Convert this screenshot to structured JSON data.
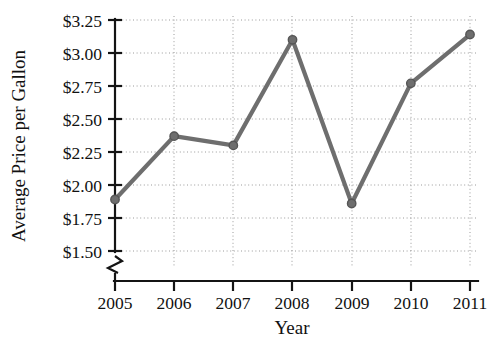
{
  "chart_data": {
    "type": "line",
    "title": "",
    "xlabel": "Year",
    "ylabel": "Average Price per Gallon",
    "categories": [
      "2005",
      "2006",
      "2007",
      "2008",
      "2009",
      "2010",
      "2011"
    ],
    "x": [
      2005,
      2006,
      2007,
      2008,
      2009,
      2010,
      2011
    ],
    "values": [
      1.89,
      2.37,
      2.3,
      3.1,
      1.86,
      2.77,
      3.14
    ],
    "series": [
      {
        "name": "Average Price per Gallon",
        "values": [
          1.89,
          2.37,
          2.3,
          3.1,
          1.86,
          2.77,
          3.14
        ]
      }
    ],
    "ytick_labels": [
      "$1.50",
      "$1.75",
      "$2.00",
      "$2.25",
      "$2.50",
      "$2.75",
      "$3.00",
      "$3.25"
    ],
    "ytick_values": [
      1.5,
      1.75,
      2.0,
      2.25,
      2.5,
      2.75,
      3.0,
      3.25
    ],
    "xtick_labels": [
      "2005",
      "2006",
      "2007",
      "2008",
      "2009",
      "2010",
      "2011"
    ],
    "ylim": [
      1.5,
      3.25
    ],
    "xlim": [
      2005,
      2011
    ],
    "grid": true,
    "grid_style": "dotted-horizontal-and-vertical",
    "legend": "none",
    "y_axis_break": true,
    "marker": "circle",
    "line_color": "#6e6e6e",
    "marker_color": "#6e6e6e",
    "axis_color": "#141414",
    "grid_color": "#9a9a9a",
    "background_color": "#ffffff"
  }
}
